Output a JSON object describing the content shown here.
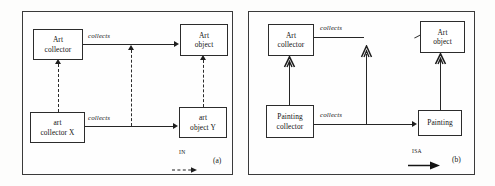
{
  "figure": {
    "type": "diagram"
  },
  "panel_a": {
    "caption": "(a)",
    "nodes": [
      {
        "id": "art-collector",
        "line1": "Art",
        "line2": "collector",
        "x": 33,
        "y": 29,
        "w": 50,
        "h": 31
      },
      {
        "id": "art-object",
        "line1": "Art",
        "line2": "object",
        "x": 180,
        "y": 24,
        "w": 48,
        "h": 32
      },
      {
        "id": "art-collector-x",
        "line1": "art",
        "line2": "collector X",
        "x": 30,
        "y": 112,
        "w": 55,
        "h": 31
      },
      {
        "id": "art-object-y",
        "line1": "art",
        "line2": "object Y",
        "x": 179,
        "y": 107,
        "w": 48,
        "h": 31
      }
    ],
    "edge_labels": [
      {
        "id": "collects-top",
        "text": "collects",
        "x": 88,
        "y": 32
      },
      {
        "id": "collects-bottom",
        "text": "collects",
        "x": 88,
        "y": 114
      }
    ],
    "legend": {
      "label": "IN",
      "style": "dashed-arrow"
    }
  },
  "panel_b": {
    "caption": "(b)",
    "nodes": [
      {
        "id": "art-collector",
        "line1": "Art",
        "line2": "collector",
        "x": 268,
        "y": 24,
        "w": 46,
        "h": 32
      },
      {
        "id": "art-object",
        "line1": "Art",
        "line2": "object",
        "x": 420,
        "y": 21,
        "w": 45,
        "h": 32
      },
      {
        "id": "painting-collector",
        "line1": "Painting",
        "line2": "collector",
        "x": 266,
        "y": 105,
        "w": 48,
        "h": 33
      },
      {
        "id": "painting",
        "line1": "Painting",
        "line2": "",
        "x": 418,
        "y": 110,
        "w": 44,
        "h": 26
      }
    ],
    "edge_labels": [
      {
        "id": "collects-top",
        "text": "collects",
        "x": 320,
        "y": 24
      },
      {
        "id": "collects-bottom",
        "text": "collects",
        "x": 320,
        "y": 111
      }
    ],
    "legend": {
      "label": "ISA",
      "style": "solid-arrow"
    }
  }
}
